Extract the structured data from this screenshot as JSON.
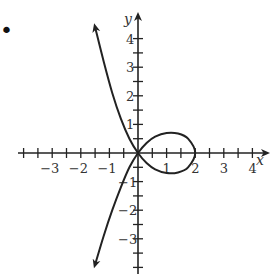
{
  "chart_data": {
    "type": "line",
    "title": "",
    "xlabel": "x",
    "ylabel": "y",
    "xlim": [
      -4,
      4
    ],
    "ylim": [
      -4,
      4
    ],
    "x_tick_labels": [
      "-3",
      "-2",
      "-1",
      "1",
      "2",
      "3",
      "4"
    ],
    "y_tick_labels": [
      "4",
      "3",
      "2",
      "1",
      "-1",
      "-2",
      "-3"
    ],
    "minor_tick_step": 0.5,
    "grid": false,
    "series": [
      {
        "name": "curve",
        "points": [
          [
            -1.5,
            4.4
          ],
          [
            -1.2,
            3.2
          ],
          [
            -0.9,
            2.1
          ],
          [
            -0.6,
            1.2
          ],
          [
            -0.3,
            0.5
          ],
          [
            0,
            0
          ],
          [
            0.3,
            -0.35
          ],
          [
            0.6,
            -0.57
          ],
          [
            1.0,
            -0.7
          ],
          [
            1.4,
            -0.68
          ],
          [
            1.75,
            -0.5
          ],
          [
            2.0,
            0
          ],
          [
            1.75,
            0.5
          ],
          [
            1.4,
            0.68
          ],
          [
            1.0,
            0.7
          ],
          [
            0.6,
            0.57
          ],
          [
            0.3,
            0.35
          ],
          [
            0,
            0
          ],
          [
            -0.3,
            -0.5
          ],
          [
            -0.6,
            -1.2
          ],
          [
            -0.9,
            -2.0
          ],
          [
            -1.2,
            -2.9
          ],
          [
            -1.5,
            -3.9
          ]
        ]
      }
    ],
    "annotations": [
      {
        "text": "•",
        "position": "top-left marker"
      }
    ]
  },
  "labels": {
    "x_axis": "x",
    "y_axis": "y",
    "bullet": "•"
  }
}
